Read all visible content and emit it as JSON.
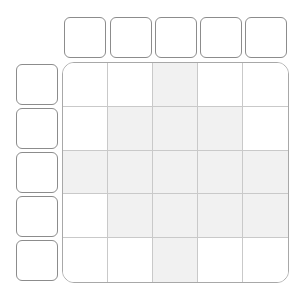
{
  "puzzle": {
    "rows": 5,
    "cols": 5,
    "column_clues": [
      "",
      "",
      "",
      "",
      ""
    ],
    "row_clues": [
      "",
      "",
      "",
      "",
      ""
    ],
    "shaded_cells": [
      [
        0,
        0,
        1,
        0,
        0
      ],
      [
        0,
        1,
        1,
        1,
        0
      ],
      [
        1,
        1,
        1,
        1,
        1
      ],
      [
        0,
        1,
        1,
        1,
        1
      ],
      [
        0,
        0,
        1,
        0,
        0
      ]
    ]
  },
  "colors": {
    "clue_border": "#8c8c8c",
    "board_border": "#a8a8a8",
    "grid_line": "#c9c9c9",
    "shaded_fill": "#f1f1f1",
    "empty_fill": "#ffffff"
  }
}
